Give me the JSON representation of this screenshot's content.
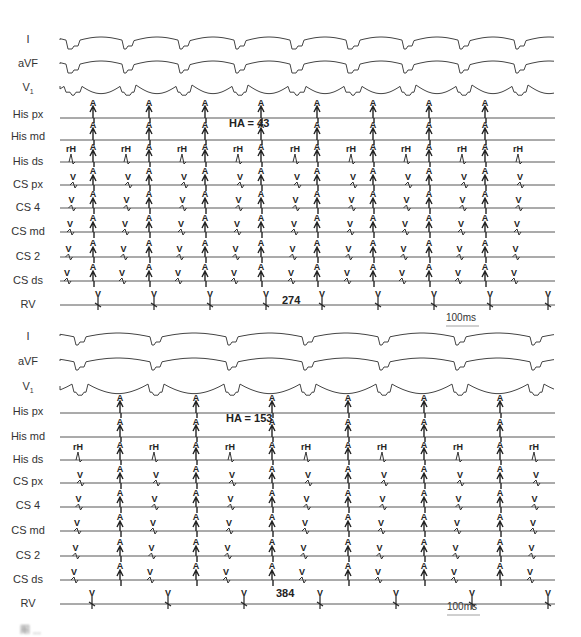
{
  "figure": {
    "type": "intracardiac-electrogram",
    "panels": [
      {
        "id": "top",
        "channels": [
          "I",
          "aVF",
          "V1",
          "His px",
          "His md",
          "His ds",
          "CS px",
          "CS 4",
          "CS md",
          "CS 2",
          "CS ds",
          "RV"
        ],
        "annotations": {
          "ha_interval": "HA = 43",
          "cycle_length": "274",
          "scale": "100ms"
        },
        "markers": {
          "atrial": "A",
          "ventricular": "V",
          "his": "rH"
        }
      },
      {
        "id": "bottom",
        "channels": [
          "I",
          "aVF",
          "V1",
          "His px",
          "His md",
          "His ds",
          "CS px",
          "CS 4",
          "CS md",
          "CS 2",
          "CS ds",
          "RV"
        ],
        "annotations": {
          "ha_interval": "HA = 153",
          "cycle_length": "384",
          "scale": "100ms"
        },
        "markers": {
          "atrial": "A",
          "ventricular": "V",
          "his": "rH"
        }
      }
    ],
    "caption": "图 ..."
  },
  "labels": {
    "top": {
      "I": "I",
      "aVF": "aVF",
      "V1": "V",
      "V1_sub": "1",
      "His_px": "His px",
      "His_md": "His md",
      "His_ds": "His ds",
      "CS_px": "CS px",
      "CS_4": "CS 4",
      "CS_md": "CS md",
      "CS_2": "CS 2",
      "CS_ds": "CS ds",
      "RV": "RV"
    },
    "bottom": {
      "I": "I",
      "aVF": "aVF",
      "V1": "V",
      "V1_sub": "1",
      "His_px": "His px",
      "His_md": "His md",
      "His_ds": "His ds",
      "CS_px": "CS px",
      "CS_4": "CS 4",
      "CS_md": "CS md",
      "CS_2": "CS 2",
      "CS_ds": "CS ds",
      "RV": "RV"
    }
  },
  "ann": {
    "top_ha": "HA = 43",
    "top_cl": "274",
    "top_scale": "100ms",
    "bottom_ha": "HA = 153",
    "bottom_cl": "384",
    "bottom_scale": "100ms"
  }
}
